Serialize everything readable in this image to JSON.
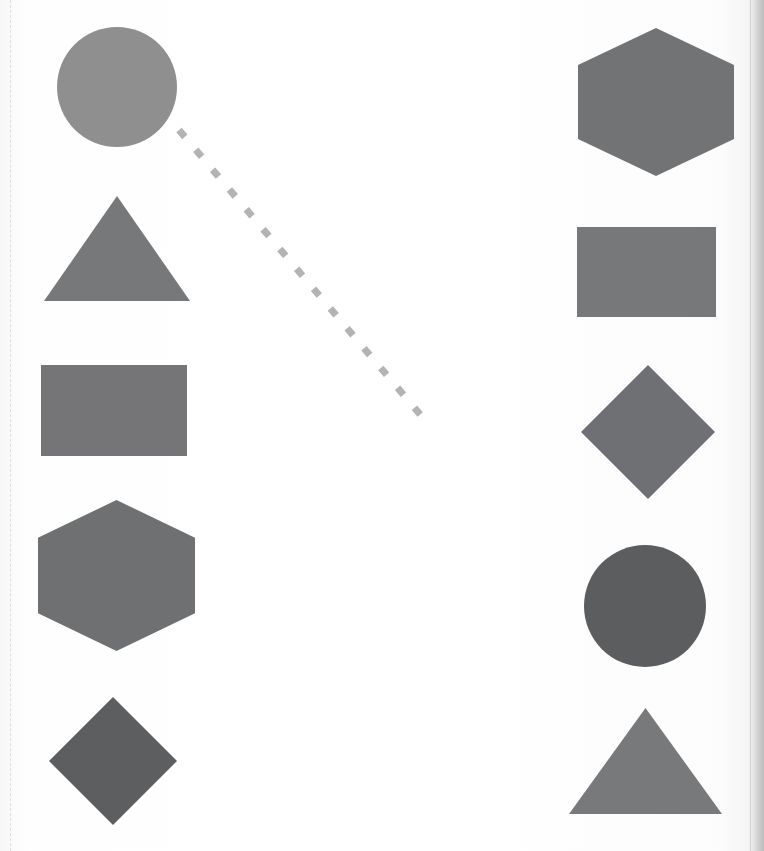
{
  "worksheet": {
    "title": "Shape Matching Worksheet",
    "width": 764,
    "height": 851,
    "background_color": "#ffffff",
    "page_edge_color": "#c9c9c9",
    "crop_guide_color": "#d8d8d8"
  },
  "palette": {
    "gray_light": "#8c8c8c",
    "gray_medium": "#6f6f6f",
    "gray_dark": "#5a5a5a",
    "connector": "#b3b3b3"
  },
  "columns": {
    "left": {
      "name": "left-column",
      "items": [
        {
          "id": "left-circle",
          "shape": "circle",
          "label": "Circle",
          "color": "#8f8f8f",
          "cx": 117,
          "cy": 87,
          "r": 60
        },
        {
          "id": "left-triangle",
          "shape": "triangle",
          "label": "Triangle",
          "color": "#77787a",
          "x": 44,
          "y": 196,
          "width": 146,
          "height": 105
        },
        {
          "id": "left-rectangle",
          "shape": "rectangle",
          "label": "Rectangle",
          "color": "#757577",
          "x": 41,
          "y": 365,
          "width": 146,
          "height": 91
        },
        {
          "id": "left-hexagon",
          "shape": "hexagon",
          "label": "Hexagon",
          "color": "#6f7072",
          "x": 38,
          "y": 500,
          "width": 157,
          "height": 151
        },
        {
          "id": "left-diamond",
          "shape": "diamond",
          "label": "Diamond",
          "color": "#5d5e60",
          "cx": 113,
          "cy": 761,
          "half": 64
        }
      ]
    },
    "right": {
      "name": "right-column",
      "items": [
        {
          "id": "right-hexagon",
          "shape": "hexagon",
          "label": "Hexagon",
          "color": "#727375",
          "x": 578,
          "y": 28,
          "width": 156,
          "height": 148
        },
        {
          "id": "right-rectangle",
          "shape": "rectangle",
          "label": "Rectangle",
          "color": "#77787a",
          "x": 577,
          "y": 227,
          "width": 139,
          "height": 90
        },
        {
          "id": "right-diamond",
          "shape": "diamond",
          "label": "Diamond",
          "color": "#6f7073",
          "cx": 648,
          "cy": 432,
          "half": 67
        },
        {
          "id": "right-circle",
          "shape": "circle",
          "label": "Circle",
          "color": "#5c5d5f",
          "cx": 645,
          "cy": 606,
          "r": 61
        },
        {
          "id": "right-triangle",
          "shape": "triangle",
          "label": "Triangle",
          "color": "#78797b",
          "x": 569,
          "y": 708,
          "width": 153,
          "height": 106
        }
      ]
    }
  },
  "connectors": [
    {
      "id": "connector-circle-to-right",
      "from": "left-circle",
      "to": "unfinished",
      "style": "dashed",
      "color": "#b3b3b3",
      "stroke_width": 7,
      "dash_pattern": "9 17",
      "x1": 179,
      "y1": 130,
      "x2": 424,
      "y2": 419
    }
  ]
}
